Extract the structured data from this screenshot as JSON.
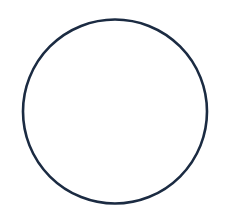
{
  "diagram": {
    "shape": "circle",
    "stroke_color": "#1b2b42",
    "fill_color": "none",
    "background_color": "#ffffff"
  }
}
